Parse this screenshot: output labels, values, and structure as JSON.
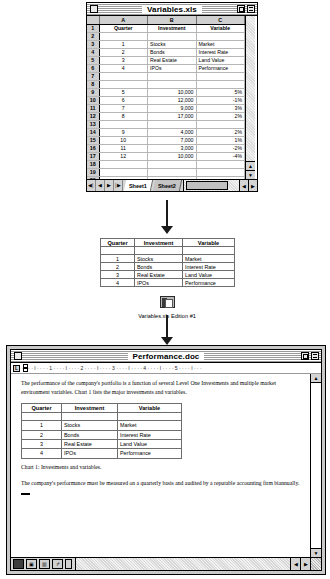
{
  "spreadsheet": {
    "title": "Variables.xls",
    "column_headers": [
      "A",
      "B",
      "C"
    ],
    "header_row": {
      "quarter": "Quarter",
      "investment": "Investment",
      "variable": "Variable"
    },
    "rows": [
      {
        "n": "1",
        "a": "Quarter",
        "b": "Investment",
        "c": "Variable",
        "header": true
      },
      {
        "n": "2",
        "a": "",
        "b": "",
        "c": ""
      },
      {
        "n": "3",
        "a": "1",
        "b": "Stocks",
        "c": "Market"
      },
      {
        "n": "4",
        "a": "2",
        "b": "Bonds",
        "c": "Interest Rate"
      },
      {
        "n": "5",
        "a": "3",
        "b": "Real Estate",
        "c": "Land Value"
      },
      {
        "n": "6",
        "a": "4",
        "b": "IPOs",
        "c": "Performance"
      },
      {
        "n": "7",
        "a": "",
        "b": "",
        "c": ""
      },
      {
        "n": "8",
        "a": "",
        "b": "",
        "c": ""
      },
      {
        "n": "9",
        "a": "5",
        "b": "10,000",
        "c": "5%",
        "num": true
      },
      {
        "n": "10",
        "a": "6",
        "b": "12,000",
        "c": "-1%",
        "num": true
      },
      {
        "n": "11",
        "a": "7",
        "b": "9,000",
        "c": "3%",
        "num": true
      },
      {
        "n": "12",
        "a": "8",
        "b": "17,000",
        "c": "2%",
        "num": true
      },
      {
        "n": "13",
        "a": "",
        "b": "",
        "c": ""
      },
      {
        "n": "14",
        "a": "9",
        "b": "4,000",
        "c": "2%",
        "num": true
      },
      {
        "n": "15",
        "a": "10",
        "b": "7,000",
        "c": "1%",
        "num": true
      },
      {
        "n": "16",
        "a": "11",
        "b": "3,000",
        "c": "-2%",
        "num": true
      },
      {
        "n": "17",
        "a": "12",
        "b": "10,000",
        "c": "-4%",
        "num": true
      },
      {
        "n": "18",
        "a": "",
        "b": "",
        "c": ""
      },
      {
        "n": "19",
        "a": "",
        "b": "",
        "c": ""
      },
      {
        "n": "20",
        "a": "",
        "b": "",
        "c": ""
      }
    ],
    "tabs": [
      {
        "label": "Sheet1",
        "active": true
      },
      {
        "label": "Sheet2",
        "active": false
      }
    ],
    "nav_first": "◀│",
    "nav_prev": "◀",
    "nav_next": "▶",
    "nav_last": "│▶",
    "scroll_up": "▲",
    "scroll_down": "▼",
    "scroll_left": "◀",
    "scroll_right": "▶"
  },
  "edition": {
    "headers": {
      "quarter": "Quarter",
      "investment": "Investment",
      "variable": "Variable"
    },
    "rows": [
      {
        "q": "",
        "i": "",
        "v": ""
      },
      {
        "q": "1",
        "i": "Stocks",
        "v": "Market"
      },
      {
        "q": "2",
        "i": "Bonds",
        "v": "Interest Rate"
      },
      {
        "q": "3",
        "i": "Real Estate",
        "v": "Land Value"
      },
      {
        "q": "4",
        "i": "IPOs",
        "v": "Performance"
      }
    ],
    "caption": "Variables.xls Edition #1"
  },
  "document": {
    "title": "Performance.doc",
    "ruler_marks": "· · · · I · · · · 1 · · · · I · · · · 2 · · · · I · · · · 3 · · · · I · · · · 4 · · · · I · · · · 5 · · · · I · · ·",
    "paragraph_1": "The performance of the company's portfolio is a function of several Level One Investments and multiple market environment variables. Chart 1 lists the major investments and variables.",
    "table": {
      "headers": {
        "quarter": "Quarter",
        "investment": "Investment",
        "variable": "Variable"
      },
      "rows": [
        {
          "q": "",
          "i": "",
          "v": ""
        },
        {
          "q": "1",
          "i": "Stocks",
          "v": "Market"
        },
        {
          "q": "2",
          "i": "Bonds",
          "v": "Interest Rate"
        },
        {
          "q": "3",
          "i": "Real Estate",
          "v": "Land Value"
        },
        {
          "q": "4",
          "i": "IPOs",
          "v": "Performance"
        }
      ]
    },
    "caption": "Chart 1: Investments and variables.",
    "paragraph_2": "The company's performance must be measured on a quarterly basis and audited by a reputable accounting firm biannually.",
    "scroll_up": "▲",
    "scroll_down": "▼",
    "scroll_left": "◀",
    "scroll_right": "▶"
  }
}
